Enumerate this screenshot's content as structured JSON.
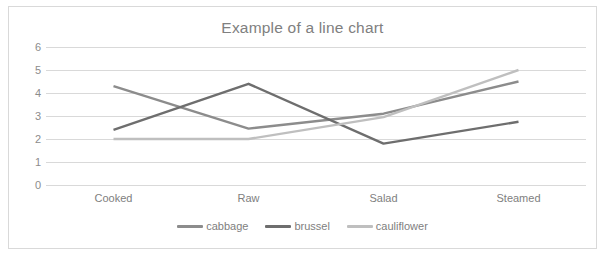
{
  "chart": {
    "title": "Example of a line chart",
    "background": "#ffffff",
    "border_color": "#d9d9d9",
    "grid_color": "#d9d9d9",
    "text_color": "#808080"
  },
  "chart_data": {
    "type": "line",
    "title": "Example of a line chart",
    "xlabel": "",
    "ylabel": "",
    "categories": [
      "Cooked",
      "Raw",
      "Salad",
      "Steamed"
    ],
    "series": [
      {
        "name": "cabbage",
        "values": [
          4.3,
          2.45,
          3.1,
          4.5
        ],
        "color": "#8c8c8c"
      },
      {
        "name": "brussel",
        "values": [
          2.4,
          4.4,
          1.8,
          2.75
        ],
        "color": "#6e6e6e"
      },
      {
        "name": "cauliflower",
        "values": [
          2.0,
          2.0,
          2.95,
          5.0
        ],
        "color": "#bfbfbf"
      }
    ],
    "ylim": [
      0,
      6
    ],
    "yticks": [
      "0",
      "1",
      "2",
      "3",
      "4",
      "5",
      "6"
    ],
    "grid": true,
    "legend_position": "bottom"
  }
}
